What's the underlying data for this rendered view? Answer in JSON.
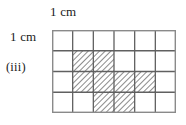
{
  "figure": {
    "part_label": "(iii)",
    "top_unit_label": "1 cm",
    "left_unit_label": "1 cm",
    "grid": {
      "columns": 6,
      "rows": 4,
      "cell_width_cm": 1,
      "cell_height_cm": 1,
      "line_color": "#606060",
      "border_color": "#8a8a8a",
      "background_color": "#ffffff",
      "hatch_color": "#5a5a5a",
      "hatch_angle_deg": 45,
      "shaded_cells": [
        {
          "row": 2,
          "col": 2
        },
        {
          "row": 2,
          "col": 3
        },
        {
          "row": 3,
          "col": 2
        },
        {
          "row": 3,
          "col": 3
        },
        {
          "row": 3,
          "col": 4
        },
        {
          "row": 3,
          "col": 5
        },
        {
          "row": 4,
          "col": 3
        },
        {
          "row": 4,
          "col": 4
        }
      ],
      "shaded_cell_count": 8,
      "total_cell_count": 24,
      "shaded_area_cm2": 8
    }
  }
}
